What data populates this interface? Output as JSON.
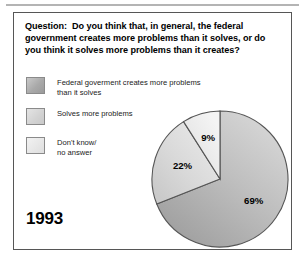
{
  "panel": {
    "question": "Question:  Do you think that, in general, the federal government creates more problems than it solves, or do you think it solves more problems than it creates?",
    "year": "1993"
  },
  "legend": {
    "items": [
      {
        "label": "Federal goverment creates more problems\nthan it solves",
        "color": "#a9a9a9",
        "swatch_name": "swatch-creates-problems"
      },
      {
        "label": "Solves more problems",
        "color": "#d2d2d2",
        "swatch_name": "swatch-solves-problems"
      },
      {
        "label": "Don't know/\nno answer",
        "color": "#e6e6e6",
        "swatch_name": "swatch-dont-know"
      }
    ]
  },
  "chart_data": {
    "type": "pie",
    "title": "Question:  Do you think that, in general, the federal government creates more problems than it solves, or do you think it solves more problems than it creates?",
    "year": "1993",
    "categories": [
      "Federal goverment creates more problems than it solves",
      "Solves more problems",
      "Don't know/ no answer"
    ],
    "values": [
      69,
      22,
      9
    ],
    "labels": [
      "69%",
      "22%",
      "9%"
    ],
    "colors": [
      "#b5b5b5",
      "#dcdcdc",
      "#ececec"
    ],
    "start_angle_deg": 0,
    "direction": "clockwise",
    "legend_position": "left",
    "grid": false,
    "xlabel": "",
    "ylabel": ""
  }
}
